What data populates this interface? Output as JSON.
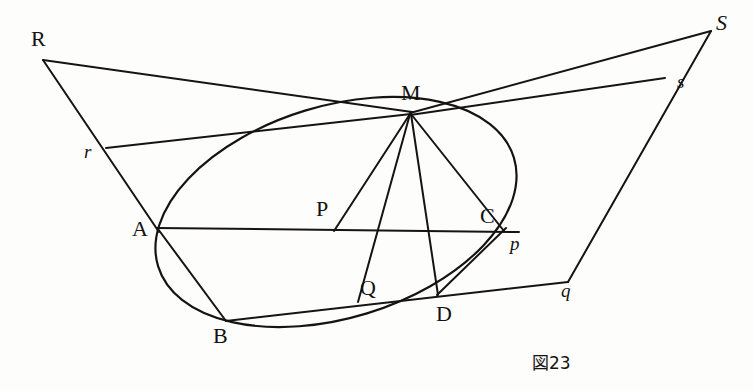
{
  "figure": {
    "caption": "図23",
    "caption_position": {
      "x": 532,
      "y": 349
    },
    "canvas": {
      "width": 754,
      "height": 391
    },
    "ink_color": "#161412",
    "background_color": "#fdfdfc"
  },
  "labels": [
    {
      "name": "label-R",
      "text": "R",
      "x": 31,
      "y": 28,
      "style": "upper"
    },
    {
      "name": "label-S",
      "text": "S",
      "x": 716,
      "y": 12,
      "style": "italic-cap"
    },
    {
      "name": "label-M",
      "text": "M",
      "x": 401,
      "y": 82,
      "style": "upper"
    },
    {
      "name": "label-r",
      "text": "r",
      "x": 84,
      "y": 142,
      "style": "lower"
    },
    {
      "name": "label-s",
      "text": "s",
      "x": 677,
      "y": 72,
      "style": "lower"
    },
    {
      "name": "label-A",
      "text": "A",
      "x": 132,
      "y": 218,
      "style": "upper"
    },
    {
      "name": "label-B",
      "text": "B",
      "x": 213,
      "y": 325,
      "style": "upper"
    },
    {
      "name": "label-C",
      "text": "C",
      "x": 480,
      "y": 205,
      "style": "upper"
    },
    {
      "name": "label-D",
      "text": "D",
      "x": 436,
      "y": 303,
      "style": "upper"
    },
    {
      "name": "label-P",
      "text": "P",
      "x": 316,
      "y": 198,
      "style": "upper"
    },
    {
      "name": "label-Q",
      "text": "Q",
      "x": 360,
      "y": 277,
      "style": "upper"
    },
    {
      "name": "label-p",
      "text": "p",
      "x": 510,
      "y": 234,
      "style": "lower"
    },
    {
      "name": "label-q",
      "text": "q",
      "x": 561,
      "y": 281,
      "style": "lower"
    }
  ],
  "geometry": {
    "points": {
      "R": {
        "x": 43,
        "y": 60
      },
      "S": {
        "x": 711,
        "y": 31
      },
      "M": {
        "x": 410,
        "y": 113
      },
      "r": {
        "x": 106,
        "y": 148
      },
      "s": {
        "x": 665,
        "y": 78
      },
      "A": {
        "x": 158,
        "y": 228
      },
      "B": {
        "x": 226,
        "y": 321
      },
      "C": {
        "x": 503,
        "y": 230
      },
      "D": {
        "x": 438,
        "y": 294
      },
      "P": {
        "x": 334,
        "y": 231
      },
      "Q": {
        "x": 358,
        "y": 301
      },
      "p": {
        "x": 513,
        "y": 227
      },
      "q": {
        "x": 568,
        "y": 282
      }
    },
    "conic": {
      "type": "ellipse",
      "center": {
        "x": 336,
        "y": 212
      },
      "rx": 186,
      "ry": 106,
      "rotation_deg": -17
    },
    "segments": [
      {
        "name": "segment-R-M",
        "from": "R",
        "to": "M"
      },
      {
        "name": "segment-R-A",
        "from": "R",
        "to": "A"
      },
      {
        "name": "segment-r-M",
        "from": "r",
        "to": "M"
      },
      {
        "name": "segment-M-S",
        "from": "M",
        "to": "S"
      },
      {
        "name": "segment-M-s",
        "from": "M",
        "to": "s"
      },
      {
        "name": "segment-S-q",
        "from": "S",
        "to": "q"
      },
      {
        "name": "segment-A-C",
        "from": "A",
        "to": "p"
      },
      {
        "name": "segment-B-q",
        "from": "B",
        "to": "q"
      },
      {
        "name": "segment-A-B",
        "from": "A",
        "to": "B"
      },
      {
        "name": "segment-M-P",
        "from": "M",
        "to": "P"
      },
      {
        "name": "segment-M-Q",
        "from": "M",
        "to": "Q"
      },
      {
        "name": "segment-M-C",
        "from": "M",
        "to": "C"
      },
      {
        "name": "segment-M-D",
        "from": "M",
        "to": "D"
      },
      {
        "name": "segment-C-D",
        "from": "C",
        "to": "D"
      }
    ]
  }
}
